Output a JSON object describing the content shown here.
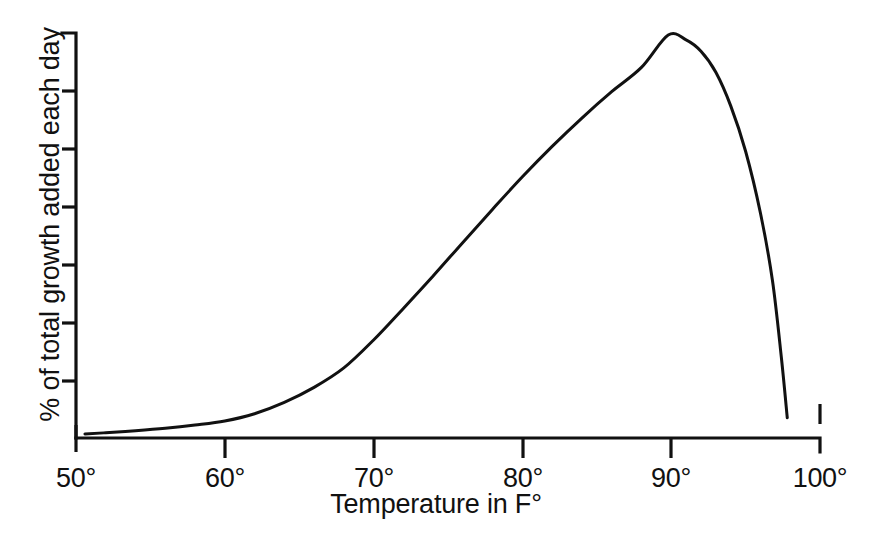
{
  "chart_data": {
    "type": "line",
    "title": "",
    "xlabel": "Temperature in F°",
    "ylabel": "% of total growth added each day",
    "xlim": [
      50,
      100
    ],
    "ylim": [
      0,
      100
    ],
    "grid": false,
    "legend": "none",
    "x_ticks": [
      50,
      60,
      70,
      80,
      90,
      100
    ],
    "x_tick_labels": [
      "50°",
      "60°",
      "70°",
      "80°",
      "90°",
      "100°"
    ],
    "y_ticks": [
      0,
      14.3,
      28.6,
      42.9,
      57.1,
      71.4,
      85.7,
      100
    ],
    "y_tick_labels": [
      "",
      "",
      "",
      "",
      "",
      "",
      "",
      ""
    ],
    "series": [
      {
        "name": "growth rate",
        "x": [
          50.6,
          52,
          54,
          56,
          58,
          60,
          62,
          64,
          66,
          68,
          70,
          72,
          74,
          76,
          78,
          80,
          82,
          84,
          86,
          88,
          89.8,
          91,
          92,
          93,
          94,
          95,
          96,
          96.8,
          97.4,
          97.8
        ],
        "y": [
          1.0,
          1.3,
          1.8,
          2.4,
          3.2,
          4.2,
          6.0,
          8.8,
          12.5,
          17.3,
          24.2,
          32.0,
          40.0,
          48.3,
          56.5,
          64.5,
          72.0,
          79.0,
          85.5,
          91.5,
          99.5,
          98.3,
          95.5,
          90.3,
          82.0,
          70.8,
          55.5,
          39.0,
          20.0,
          5.0
        ]
      }
    ]
  },
  "axis": {
    "x_tick_labels": [
      "50°",
      "60°",
      "70°",
      "80°",
      "90°",
      "100°"
    ],
    "x_title": "Temperature in F°",
    "y_title": "% of total growth added each day"
  },
  "colors": {
    "background": "#ffffff",
    "ink": "#111111",
    "curve": "#111111"
  }
}
